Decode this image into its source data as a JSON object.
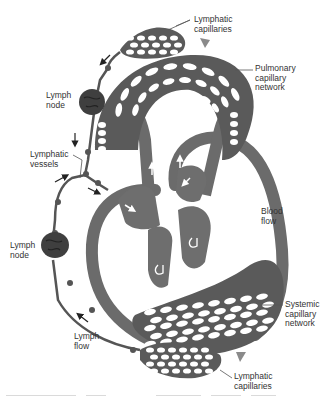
{
  "figure": {
    "colors": {
      "vessel": "#6b6b6b",
      "vessel_dark": "#4a4a4a",
      "heart": "#6e6e6e",
      "capillary_hole": "#ffffff",
      "label_text": "#333333",
      "flow_arrow": "#8a8a8a",
      "leader_line": "#555555"
    }
  },
  "labels": {
    "lymphatic_capillaries_top": "Lymphatic\ncapillaries",
    "pulmonary_capillary_network": "Pulmonary\ncapillary\nnetwork",
    "lymph_node_top": "Lymph\nnode",
    "lymphatic_vessels": "Lymphatic\nvessels",
    "blood_flow": "Blood\nflow",
    "lymph_node_bottom": "Lymph\nnode",
    "systemic_capillary_network": "Systemic\ncapillary\nnetwork",
    "lymph_flow": "Lymph\nflow",
    "lymphatic_capillaries_bottom": "Lymphatic\ncapillaries"
  },
  "structures": [
    "pulmonary-capillary-network",
    "systemic-capillary-network",
    "heart",
    "lymphatic-capillaries-top",
    "lymphatic-capillaries-bottom",
    "lymph-node-top",
    "lymph-node-bottom",
    "lymphatic-vessels"
  ]
}
